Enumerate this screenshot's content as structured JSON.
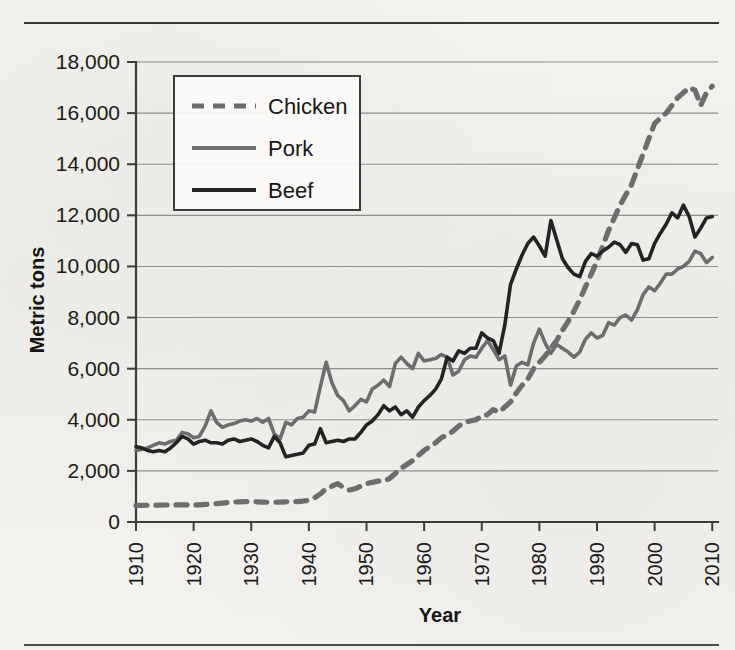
{
  "figure": {
    "has_top_rule": true,
    "has_bottom_rule": true,
    "background_hex": "#f2f1ee"
  },
  "chart_data": {
    "type": "line",
    "title": "",
    "subtitle": "",
    "xlabel": "Year",
    "ylabel": "Metric tons",
    "xlim": [
      1910,
      2011
    ],
    "ylim": [
      0,
      18000
    ],
    "grid": true,
    "grid_axis": "y",
    "legend_position": "upper-left-inside",
    "x_tick_labels": [
      "1910",
      "1920",
      "1930",
      "1940",
      "1950",
      "1960",
      "1970",
      "1980",
      "1990",
      "2000",
      "2010"
    ],
    "x_tick_values": [
      1910,
      1920,
      1930,
      1940,
      1950,
      1960,
      1970,
      1980,
      1990,
      2000,
      2010
    ],
    "x_tick_rotation_degrees": 90,
    "y_tick_labels": [
      "0",
      "2,000",
      "4,000",
      "6,000",
      "8,000",
      "10,000",
      "12,000",
      "14,000",
      "16,000",
      "18,000"
    ],
    "y_tick_values": [
      0,
      2000,
      4000,
      6000,
      8000,
      10000,
      12000,
      14000,
      16000,
      18000
    ],
    "legend": [
      {
        "name": "Chicken",
        "style": "dashed",
        "color_hex": "#6d6d6d"
      },
      {
        "name": "Pork",
        "style": "solid",
        "color_hex": "#6d6d6d"
      },
      {
        "name": "Beef",
        "style": "solid",
        "color_hex": "#232323"
      }
    ],
    "x": [
      1910,
      1911,
      1912,
      1913,
      1914,
      1915,
      1916,
      1917,
      1918,
      1919,
      1920,
      1921,
      1922,
      1923,
      1924,
      1925,
      1926,
      1927,
      1928,
      1929,
      1930,
      1931,
      1932,
      1933,
      1934,
      1935,
      1936,
      1937,
      1938,
      1939,
      1940,
      1941,
      1942,
      1943,
      1944,
      1945,
      1946,
      1947,
      1948,
      1949,
      1950,
      1951,
      1952,
      1953,
      1954,
      1955,
      1956,
      1957,
      1958,
      1959,
      1960,
      1961,
      1962,
      1963,
      1964,
      1965,
      1966,
      1967,
      1968,
      1969,
      1970,
      1971,
      1972,
      1973,
      1974,
      1975,
      1976,
      1977,
      1978,
      1979,
      1980,
      1981,
      1982,
      1983,
      1984,
      1985,
      1986,
      1987,
      1988,
      1989,
      1990,
      1991,
      1992,
      1993,
      1994,
      1995,
      1996,
      1997,
      1998,
      1999,
      2000,
      2001,
      2002,
      2003,
      2004,
      2005,
      2006,
      2007,
      2008,
      2009,
      2010
    ],
    "series": [
      {
        "name": "Chicken",
        "style": "dashed",
        "color_hex": "#6d6d6d",
        "values": [
          650,
          650,
          655,
          660,
          660,
          665,
          665,
          670,
          675,
          670,
          665,
          670,
          690,
          700,
          720,
          740,
          760,
          780,
          790,
          800,
          800,
          790,
          780,
          770,
          770,
          780,
          790,
          800,
          800,
          820,
          850,
          950,
          1100,
          1300,
          1400,
          1500,
          1350,
          1250,
          1300,
          1400,
          1500,
          1550,
          1600,
          1600,
          1700,
          1900,
          2100,
          2250,
          2400,
          2600,
          2800,
          2950,
          3100,
          3300,
          3400,
          3550,
          3750,
          3900,
          3950,
          4000,
          4150,
          4200,
          4400,
          4300,
          4500,
          4700,
          5050,
          5350,
          5600,
          6000,
          6250,
          6500,
          6800,
          7100,
          7500,
          7850,
          8250,
          8700,
          9200,
          9700,
          10200,
          10800,
          11400,
          11900,
          12400,
          12800,
          13200,
          13800,
          14400,
          15000,
          15600,
          15800,
          16000,
          16300,
          16600,
          16800,
          17000,
          16900,
          16300,
          16800,
          17050
        ]
      },
      {
        "name": "Pork",
        "style": "solid",
        "color_hex": "#6d6d6d",
        "values": [
          2800,
          2850,
          2900,
          3000,
          3100,
          3050,
          3150,
          3200,
          3500,
          3450,
          3300,
          3350,
          3750,
          4350,
          3900,
          3700,
          3800,
          3850,
          3950,
          4000,
          3950,
          4050,
          3900,
          4050,
          3450,
          3250,
          3900,
          3800,
          4050,
          4100,
          4350,
          4300,
          5300,
          6250,
          5450,
          4950,
          4750,
          4350,
          4550,
          4800,
          4700,
          5200,
          5350,
          5550,
          5300,
          6200,
          6450,
          6200,
          6000,
          6600,
          6300,
          6350,
          6400,
          6550,
          6450,
          5750,
          5900,
          6350,
          6500,
          6450,
          6800,
          7100,
          6750,
          6350,
          6500,
          5350,
          6100,
          6250,
          6150,
          7000,
          7550,
          7000,
          6600,
          6950,
          6800,
          6650,
          6450,
          6650,
          7150,
          7400,
          7200,
          7300,
          7800,
          7700,
          8000,
          8100,
          7900,
          8300,
          8900,
          9200,
          9050,
          9350,
          9700,
          9700,
          9900,
          10000,
          10200,
          10600,
          10500,
          10150,
          10350
        ]
      },
      {
        "name": "Beef",
        "style": "solid",
        "color_hex": "#232323",
        "values": [
          2950,
          2900,
          2800,
          2750,
          2800,
          2750,
          2900,
          3100,
          3350,
          3250,
          3050,
          3150,
          3200,
          3100,
          3100,
          3050,
          3200,
          3250,
          3150,
          3200,
          3250,
          3150,
          3000,
          2900,
          3350,
          3100,
          2550,
          2600,
          2650,
          2700,
          3000,
          3050,
          3650,
          3100,
          3150,
          3200,
          3150,
          3250,
          3250,
          3500,
          3800,
          3950,
          4200,
          4550,
          4350,
          4500,
          4200,
          4350,
          4100,
          4500,
          4750,
          4950,
          5200,
          5600,
          6450,
          6300,
          6700,
          6600,
          6800,
          6800,
          7400,
          7200,
          7100,
          6600,
          7700,
          9300,
          9900,
          10450,
          10900,
          11150,
          10800,
          10400,
          11800,
          11050,
          10300,
          9950,
          9700,
          9600,
          10200,
          10500,
          10400,
          10600,
          10750,
          10950,
          10850,
          10550,
          10900,
          10850,
          10250,
          10300,
          10900,
          11300,
          11650,
          12100,
          11900,
          12400,
          11950,
          11150,
          11500,
          11900,
          11950
        ]
      }
    ]
  }
}
